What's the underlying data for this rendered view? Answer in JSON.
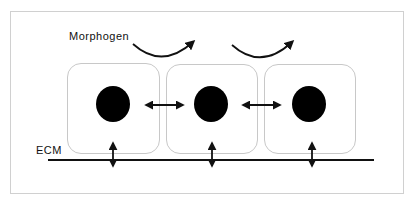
{
  "diagram": {
    "labels": {
      "morphogen": "Morphogen",
      "ecm": "ECM"
    },
    "cells": [
      {
        "id": "cell-1",
        "has_nucleus": true
      },
      {
        "id": "cell-2",
        "has_nucleus": true
      },
      {
        "id": "cell-3",
        "has_nucleus": true
      }
    ],
    "connections": {
      "cell_to_cell": [
        {
          "from": "cell-1",
          "to": "cell-2",
          "type": "bidirectional"
        },
        {
          "from": "cell-2",
          "to": "cell-3",
          "type": "bidirectional"
        }
      ],
      "cell_to_ecm": [
        {
          "from": "cell-1",
          "to": "ECM",
          "type": "bidirectional"
        },
        {
          "from": "cell-2",
          "to": "ECM",
          "type": "bidirectional"
        },
        {
          "from": "cell-3",
          "to": "ECM",
          "type": "bidirectional"
        }
      ],
      "morphogen_flow": [
        {
          "from": "cell-1",
          "to": "cell-2",
          "type": "curved-arrow"
        },
        {
          "from": "cell-2",
          "to": "cell-3",
          "type": "curved-arrow"
        }
      ]
    },
    "colors": {
      "stroke": "#111111",
      "cell_border": "#c8c8c8",
      "frame_border": "#d0d0d0",
      "nucleus": "#000000",
      "background": "#ffffff"
    }
  }
}
